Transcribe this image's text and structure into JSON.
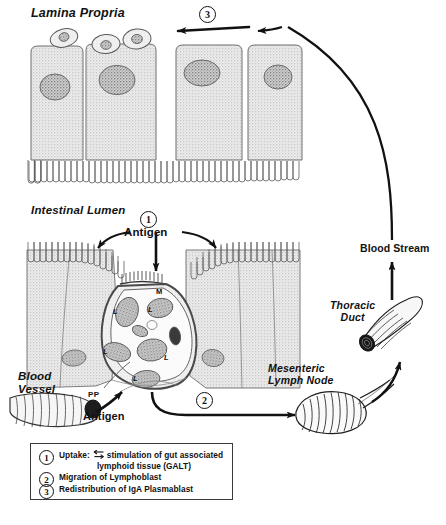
{
  "labels": {
    "lamina_propria": "Lamina Propria",
    "intestinal_lumen": "Intestinal Lumen",
    "blood_vessel": "Blood\nVessel",
    "mesenteric_lymph_node": "Mesenteric\nLymph Node",
    "thoracic_duct": "Thoracic\nDuct",
    "blood_stream": "Blood Stream",
    "antigen_lumen": "Antigen",
    "antigen_vessel": "Antigen",
    "peyers_patch": "PP",
    "m_cell": "M"
  },
  "lymphocyte_labels": [
    {
      "text": "L",
      "x": 113,
      "y": 307
    },
    {
      "text": "L",
      "x": 148,
      "y": 305
    },
    {
      "text": "L",
      "x": 103,
      "y": 347
    },
    {
      "text": "L",
      "x": 164,
      "y": 353
    },
    {
      "text": "L",
      "x": 133,
      "y": 374
    }
  ],
  "steps": [
    {
      "id": "1",
      "number": "①",
      "glyph": "1"
    },
    {
      "id": "2",
      "number": "②",
      "glyph": "2"
    },
    {
      "id": "3",
      "number": "③",
      "glyph": "3"
    }
  ],
  "step_markers": {
    "one": "1",
    "two": "2",
    "three": "3"
  },
  "legend": {
    "items": [
      {
        "number": "1",
        "text_before": "Uptake:",
        "has_arrow_symbol": true,
        "text_after": "stimulation of gut associated",
        "text_line2": "lymphoid  tissue  (GALT)"
      },
      {
        "number": "2",
        "text_before": "Migration of Lymphoblast",
        "has_arrow_symbol": false,
        "text_after": "",
        "text_line2": ""
      },
      {
        "number": "3",
        "text_before": "Redistribution of IgA Plasmablast",
        "has_arrow_symbol": false,
        "text_after": "",
        "text_line2": ""
      }
    ]
  },
  "colors": {
    "ink": "#111111",
    "cell_fill": "#d8d8d8",
    "nucleus_fill": "#a8a8a8",
    "background": "#ffffff",
    "legend_border": "#3a3a3a"
  }
}
